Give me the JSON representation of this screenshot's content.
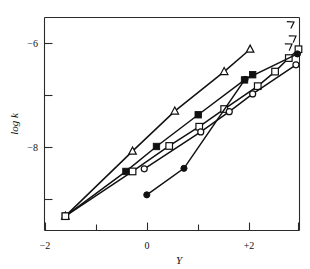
{
  "figure": {
    "background_color": "#ffffff",
    "ink_color": "#111111"
  },
  "axes": {
    "x_axis_title": "Y",
    "y_axis_title": "log k",
    "x_tick_labels": [
      "−2",
      "0",
      "+2"
    ],
    "y_tick_labels": [
      "−6",
      "−8"
    ]
  },
  "chart_data": {
    "type": "scatter",
    "title": "",
    "xlabel": "Y",
    "ylabel": "log k",
    "xlim": [
      -2.0,
      3.05
    ],
    "ylim": [
      -9.6,
      -5.62
    ],
    "grid": false,
    "legend": "none",
    "x_ticks": [
      -2,
      -1,
      0,
      1,
      2,
      3
    ],
    "x_tick_labels_shown": {
      "-2": "−2",
      "0": "0",
      "2": "+2"
    },
    "y_ticks": [
      -6,
      -7,
      -8,
      -9
    ],
    "y_tick_labels_shown": {
      "-6": "−6",
      "-8": "−8"
    },
    "series": [
      {
        "name": "open-triangle",
        "marker": "triangle-open",
        "line": true,
        "points": [
          {
            "x": -1.6,
            "y": -9.33
          },
          {
            "x": -0.28,
            "y": -8.08
          },
          {
            "x": 0.55,
            "y": -7.31
          },
          {
            "x": 1.52,
            "y": -6.55
          },
          {
            "x": 2.03,
            "y": -6.12
          }
        ]
      },
      {
        "name": "filled-square",
        "marker": "square-filled",
        "line": true,
        "points": [
          {
            "x": -1.6,
            "y": -9.33
          },
          {
            "x": -0.41,
            "y": -8.47
          },
          {
            "x": 0.19,
            "y": -7.99
          },
          {
            "x": 1.01,
            "y": -7.38
          },
          {
            "x": 1.92,
            "y": -6.71
          },
          {
            "x": 2.08,
            "y": -6.61
          }
        ]
      },
      {
        "name": "open-square",
        "marker": "square-open",
        "line": true,
        "points": [
          {
            "x": -1.6,
            "y": -9.33
          },
          {
            "x": -0.28,
            "y": -8.47
          },
          {
            "x": 0.44,
            "y": -7.98
          },
          {
            "x": 1.03,
            "y": -7.61
          },
          {
            "x": 1.52,
            "y": -7.27
          },
          {
            "x": 2.18,
            "y": -6.83
          },
          {
            "x": 2.52,
            "y": -6.55
          },
          {
            "x": 2.79,
            "y": -6.29
          },
          {
            "x": 2.98,
            "y": -6.12
          }
        ]
      },
      {
        "name": "open-circle",
        "marker": "circle-open",
        "line": true,
        "points": [
          {
            "x": -0.05,
            "y": -8.42
          },
          {
            "x": 1.06,
            "y": -7.71
          },
          {
            "x": 1.62,
            "y": -7.32
          },
          {
            "x": 2.08,
            "y": -6.98
          },
          {
            "x": 2.93,
            "y": -6.42
          }
        ]
      },
      {
        "name": "filled-circle",
        "marker": "circle-filled",
        "line": true,
        "points": [
          {
            "x": 0.0,
            "y": -8.92
          },
          {
            "x": 0.73,
            "y": -8.41
          },
          {
            "x": 1.93,
            "y": -6.7
          },
          {
            "x": 2.96,
            "y": -6.21
          }
        ]
      }
    ]
  }
}
